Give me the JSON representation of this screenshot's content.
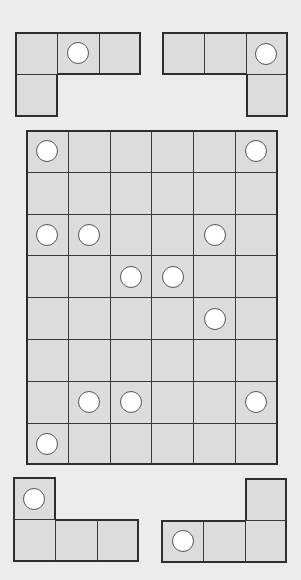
{
  "game": {
    "type": "polyomino-disc-puzzle",
    "colors": {
      "background": "#ececec",
      "cell": "#dcdcdc",
      "grid_line": "#3a3a3a",
      "disc": "#ffffff"
    },
    "board": {
      "rows": 8,
      "cols": 6,
      "discs": [
        [
          0,
          0
        ],
        [
          0,
          5
        ],
        [
          2,
          0
        ],
        [
          2,
          1
        ],
        [
          2,
          4
        ],
        [
          3,
          2
        ],
        [
          3,
          3
        ],
        [
          4,
          4
        ],
        [
          6,
          1
        ],
        [
          6,
          2
        ],
        [
          6,
          5
        ],
        [
          7,
          0
        ]
      ]
    },
    "pieces": [
      {
        "name": "piece-top-left",
        "cells": [
          [
            0,
            0
          ],
          [
            0,
            1
          ],
          [
            0,
            2
          ],
          [
            1,
            0
          ]
        ],
        "discs": [
          [
            0,
            1
          ]
        ]
      },
      {
        "name": "piece-top-right",
        "cells": [
          [
            0,
            0
          ],
          [
            0,
            1
          ],
          [
            0,
            2
          ],
          [
            1,
            2
          ]
        ],
        "discs": [
          [
            0,
            2
          ]
        ]
      },
      {
        "name": "piece-bottom-left",
        "cells": [
          [
            0,
            0
          ],
          [
            1,
            0
          ],
          [
            1,
            1
          ],
          [
            1,
            2
          ]
        ],
        "discs": [
          [
            0,
            0
          ]
        ]
      },
      {
        "name": "piece-bottom-right",
        "cells": [
          [
            0,
            2
          ],
          [
            1,
            0
          ],
          [
            1,
            1
          ],
          [
            1,
            2
          ]
        ],
        "discs": [
          [
            1,
            0
          ]
        ]
      }
    ]
  }
}
